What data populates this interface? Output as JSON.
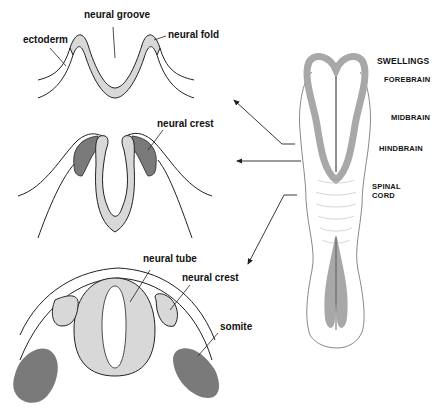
{
  "diagram": {
    "colors": {
      "tissue_light": "#d8d8d8",
      "tissue_dark": "#7a7a7a",
      "embryo_gray": "#a8a8a8",
      "outline": "#222222",
      "background": "#ffffff"
    },
    "panels": [
      {
        "id": "neural-groove-stage",
        "labels": {
          "neural_groove": "neural groove",
          "ectoderm": "ectoderm",
          "neural_fold": "neural fold"
        }
      },
      {
        "id": "neural-crest-stage",
        "labels": {
          "neural_crest": "neural crest"
        }
      },
      {
        "id": "neural-tube-stage",
        "labels": {
          "neural_tube": "neural tube",
          "neural_crest": "neural crest",
          "somite": "somite"
        }
      }
    ],
    "embryo": {
      "labels": {
        "swellings": "SWELLINGS",
        "forebrain": "FOREBRAIN",
        "midbrain": "MIDBRAIN",
        "hindbrain": "HINDBRAIN",
        "spinal_cord_1": "SPINAL",
        "spinal_cord_2": "CORD"
      }
    },
    "arrows": [
      {
        "from": "embryo",
        "to": "neural-groove-stage"
      },
      {
        "from": "embryo",
        "to": "neural-crest-stage"
      },
      {
        "from": "embryo",
        "to": "neural-tube-stage"
      }
    ]
  }
}
